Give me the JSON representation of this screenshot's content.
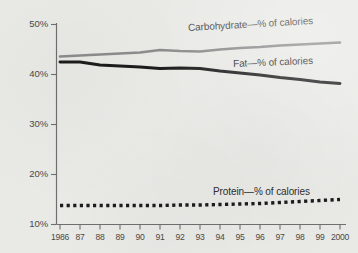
{
  "chart_data": {
    "type": "line",
    "title": "",
    "xlabel": "",
    "ylabel": "",
    "x": [
      1986,
      1987,
      1988,
      1989,
      1990,
      1991,
      1992,
      1993,
      1994,
      1995,
      1996,
      1997,
      1998,
      1999,
      2000
    ],
    "xtick_labels": [
      "1986",
      "87",
      "88",
      "89",
      "90",
      "91",
      "92",
      "93",
      "94",
      "95",
      "96",
      "97",
      "98",
      "99",
      "2000"
    ],
    "ytick_labels": [
      "50%",
      "40%",
      "30%",
      "20%",
      "10%"
    ],
    "ytick_values": [
      50,
      40,
      30,
      20,
      10
    ],
    "ylim": [
      10,
      50
    ],
    "grid": false,
    "legend_position": "inline-annotations",
    "series": [
      {
        "name": "Carbohydrate—% of calories",
        "label": "Carbohydrate—% of calories",
        "color": "#8c8c8c",
        "style": "solid",
        "values": [
          43.6,
          43.8,
          44.0,
          44.2,
          44.4,
          44.9,
          44.7,
          44.6,
          45.0,
          45.3,
          45.5,
          45.8,
          46.0,
          46.2,
          46.4
        ]
      },
      {
        "name": "Fat—% of calories",
        "label": "Fat—% of calories",
        "color": "#1c1c1c",
        "style": "solid",
        "values": [
          42.5,
          42.5,
          41.9,
          41.7,
          41.5,
          41.2,
          41.3,
          41.2,
          40.7,
          40.3,
          39.9,
          39.4,
          39.0,
          38.5,
          38.2
        ]
      },
      {
        "name": "Protein—% of calories",
        "label": "Protein—% of calories",
        "color": "#1c1c1c",
        "style": "dotted",
        "values": [
          13.8,
          13.8,
          13.8,
          13.8,
          13.8,
          13.8,
          13.9,
          13.9,
          14.0,
          14.1,
          14.2,
          14.4,
          14.6,
          14.8,
          15.0
        ]
      }
    ]
  },
  "axis": {
    "y_label_50": "50%",
    "y_label_40": "40%",
    "y_label_30": "30%",
    "y_label_20": "20%",
    "y_label_10": "10%"
  },
  "labels": {
    "carbohydrate": "Carbohydrate—% of calories",
    "fat": "Fat—% of calories",
    "protein": "Protein—% of calories"
  },
  "colors": {
    "background": "#e9e9e6",
    "carbohydrate_line": "#8c8c8c",
    "fat_line": "#1c1c1c",
    "protein_line": "#1c1c1c",
    "axis": "#6f6f6f",
    "tick_text": "#4a4a4a"
  }
}
